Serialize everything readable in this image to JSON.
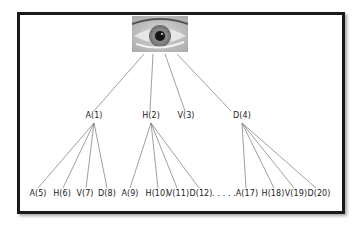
{
  "diagram": {
    "root": {
      "label": "eye-image",
      "icon": "eye-photo"
    },
    "level1": [
      {
        "label": "A(1)",
        "x": 94
      },
      {
        "label": "H(2)",
        "x": 151
      },
      {
        "label": "V(3)",
        "x": 186
      },
      {
        "label": "D(4)",
        "x": 242
      }
    ],
    "level2": [
      {
        "label": "A(5)",
        "x": 38
      },
      {
        "label": "H(6)",
        "x": 62
      },
      {
        "label": "V(7)",
        "x": 85
      },
      {
        "label": "D(8)",
        "x": 107
      },
      {
        "label": "A(9)",
        "x": 130
      },
      {
        "label": "H(10)",
        "x": 157
      },
      {
        "label": "V(11)",
        "x": 178
      },
      {
        "label": "D(12)",
        "x": 201
      },
      {
        "label": ". . . . .",
        "x": 224
      },
      {
        "label": "A(17)",
        "x": 247
      },
      {
        "label": "H(18)",
        "x": 273
      },
      {
        "label": "V(19)",
        "x": 296
      },
      {
        "label": "D(20)",
        "x": 319
      }
    ]
  }
}
